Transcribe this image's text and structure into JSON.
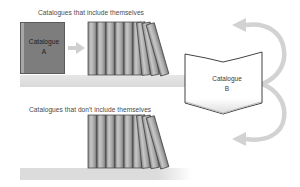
{
  "diagram": {
    "top_caption": "Catalogues that include themselves",
    "bottom_caption": "Catalogues that don't include themselves",
    "catalogue_a": {
      "line1": "Catalogue",
      "line2": "A"
    },
    "catalogue_b": {
      "line1": "Catalogue",
      "line2": "B"
    },
    "top_shelf": {
      "upright_books": 6,
      "leaning_books": 3
    },
    "bottom_shelf": {
      "upright_books": 6,
      "leaning_books": 3
    },
    "arrows": [
      {
        "from": "catalogue-a",
        "to": "top-shelf",
        "style": "small-straight"
      },
      {
        "from": "catalogue-b",
        "to": "top-shelf",
        "style": "curved"
      },
      {
        "from": "catalogue-b",
        "to": "bottom-shelf",
        "style": "curved"
      }
    ],
    "colors": {
      "book_dark": "#7d7d7d",
      "book_outline": "#3c3c3c",
      "shelf": "#dcdcdc",
      "arrow": "#cfcfcf",
      "text": "#4a4a4a"
    }
  }
}
